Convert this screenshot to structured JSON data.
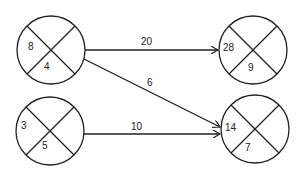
{
  "diagram": {
    "nodes": [
      {
        "id": "A",
        "left": "8",
        "bottom": "4",
        "cx": 51,
        "cy": 50
      },
      {
        "id": "B",
        "left": "3",
        "bottom": "5",
        "cx": 50,
        "cy": 131
      },
      {
        "id": "C",
        "left": "28",
        "bottom": "9",
        "cx": 253,
        "cy": 50
      },
      {
        "id": "D",
        "left": "14",
        "bottom": "7",
        "cx": 255,
        "cy": 129
      }
    ],
    "edges": [
      {
        "from": "A",
        "to": "C",
        "label": "20"
      },
      {
        "from": "A",
        "to": "D",
        "label": "6"
      },
      {
        "from": "B",
        "to": "D",
        "label": "10"
      }
    ]
  }
}
